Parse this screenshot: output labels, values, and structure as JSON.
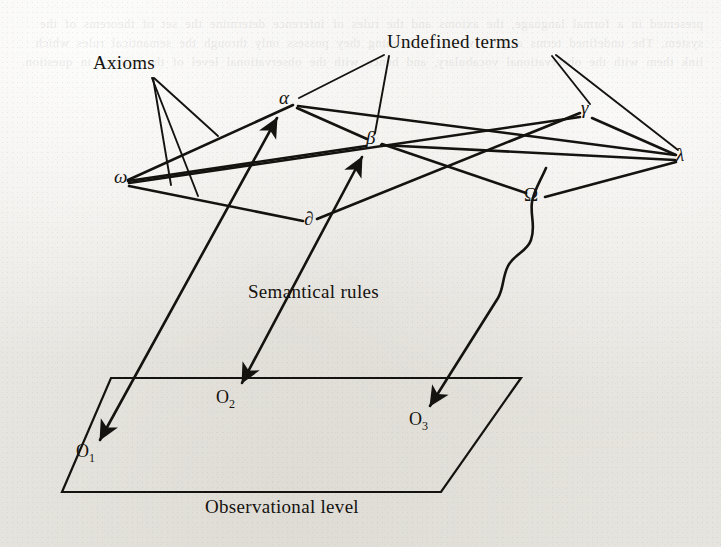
{
  "figure": {
    "type": "diagram",
    "background_color": "#eeedea",
    "ink_color": "#15130f",
    "annotations": {
      "axioms": "Axioms",
      "undefined_terms": "Undefined terms",
      "semantical_rules": "Semantical rules",
      "observational_level": "Observational level"
    },
    "theoretical_nodes": [
      {
        "id": "omega",
        "label": "ω",
        "x": 120,
        "y": 180
      },
      {
        "id": "alpha",
        "label": "α",
        "x": 286,
        "y": 101
      },
      {
        "id": "beta",
        "label": "β",
        "x": 371,
        "y": 141
      },
      {
        "id": "gamma",
        "label": "γ",
        "x": 586,
        "y": 111
      },
      {
        "id": "lambda",
        "label": "λ",
        "x": 681,
        "y": 158
      },
      {
        "id": "delta",
        "label": "∂",
        "x": 309,
        "y": 222
      },
      {
        "id": "omega_cap",
        "label": "Ω",
        "x": 530,
        "y": 198
      }
    ],
    "observational_nodes": [
      {
        "id": "O1",
        "base": "O",
        "sub": "1",
        "x": 82,
        "y": 455
      },
      {
        "id": "O2",
        "base": "O",
        "sub": "2",
        "x": 222,
        "y": 400
      },
      {
        "id": "O3",
        "base": "O",
        "sub": "3",
        "x": 415,
        "y": 422
      }
    ],
    "theoretical_edges": [
      {
        "from": "omega",
        "to": "alpha",
        "arrow": false
      },
      {
        "from": "omega",
        "to": "beta",
        "arrow": false
      },
      {
        "from": "omega",
        "to": "gamma",
        "arrow": false
      },
      {
        "from": "omega",
        "to": "delta",
        "arrow": false
      },
      {
        "from": "alpha",
        "to": "beta",
        "arrow": false
      },
      {
        "from": "alpha",
        "to": "lambda",
        "arrow": false
      },
      {
        "from": "beta",
        "to": "lambda",
        "arrow": false
      },
      {
        "from": "gamma",
        "to": "lambda",
        "arrow": false
      },
      {
        "from": "delta",
        "to": "gamma",
        "arrow": false
      },
      {
        "from": "omega_cap",
        "to": "beta",
        "arrow": false
      },
      {
        "from": "omega_cap",
        "to": "lambda",
        "arrow": false
      }
    ],
    "semantical_rule_arrows": [
      {
        "from": "O1",
        "to": "alpha",
        "arrow_at": "alpha",
        "second_arrow_at": "O1"
      },
      {
        "from": "O2",
        "to": "beta",
        "arrow_at": "beta",
        "second_arrow_at": "O2"
      },
      {
        "from": "omega_cap",
        "to": "O3",
        "arrow_at": "O3",
        "style": "wavy"
      }
    ],
    "leader_lines": {
      "axioms_origin": {
        "x": 152,
        "y": 78
      },
      "axioms_targets": 3,
      "undefined_terms_left_origin": {
        "x": 384,
        "y": 54
      },
      "undefined_terms_right_origin": {
        "x": 552,
        "y": 54
      },
      "undefined_terms_targets": 4
    },
    "plane": {
      "top_left": {
        "x": 111,
        "y": 378
      },
      "top_right": {
        "x": 521,
        "y": 378
      },
      "bottom_right": {
        "x": 441,
        "y": 492
      },
      "bottom_left": {
        "x": 62,
        "y": 492
      }
    }
  },
  "bleed_through_text": "presented in a formal language, the axioms and the rules of inference determine the set of theorems of the system. The undefined terms acquire whatever meaning they possess only through the semantical rules which link them with the observational vocabulary, and hence with the observational level of the science in question."
}
